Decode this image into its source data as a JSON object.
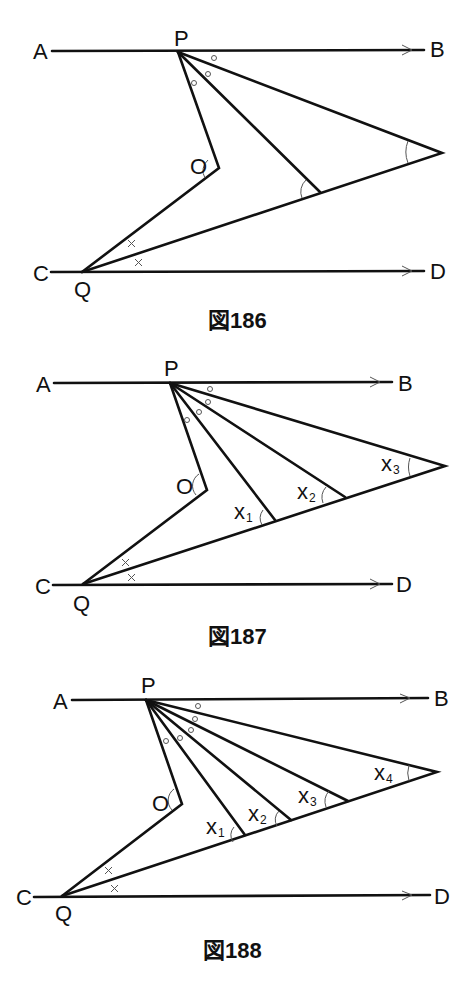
{
  "figures": [
    {
      "caption": "図186",
      "labels": {
        "A": "A",
        "B": "B",
        "C": "C",
        "D": "D",
        "P": "P",
        "Q": "Q",
        "O": "O"
      },
      "angle_labels": []
    },
    {
      "caption": "図187",
      "labels": {
        "A": "A",
        "B": "B",
        "C": "C",
        "D": "D",
        "P": "P",
        "Q": "Q",
        "O": "O"
      },
      "angle_labels": [
        {
          "base": "x",
          "sub": "1"
        },
        {
          "base": "x",
          "sub": "2"
        },
        {
          "base": "x",
          "sub": "3"
        }
      ]
    },
    {
      "caption": "図188",
      "labels": {
        "A": "A",
        "B": "B",
        "C": "C",
        "D": "D",
        "P": "P",
        "Q": "Q",
        "O": "O"
      },
      "angle_labels": [
        {
          "base": "x",
          "sub": "1"
        },
        {
          "base": "x",
          "sub": "2"
        },
        {
          "base": "x",
          "sub": "3"
        },
        {
          "base": "x",
          "sub": "4"
        }
      ]
    }
  ],
  "markers": {
    "equal_angle_top": "○",
    "equal_angle_bottom": "×"
  }
}
